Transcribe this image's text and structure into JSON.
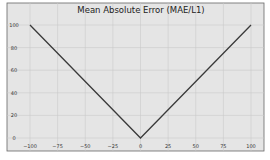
{
  "chart_data": {
    "type": "line",
    "title": "Mean Absolute Error (MAE/L1)",
    "xlabel": "",
    "ylabel": "",
    "xlim": [
      -100,
      100
    ],
    "ylim": [
      0,
      100
    ],
    "grid": true,
    "legend": null,
    "x_ticks": [
      "−100",
      "−75",
      "−50",
      "−25",
      "0",
      "25",
      "50",
      "75",
      "100"
    ],
    "y_ticks": [
      "0",
      "20",
      "40",
      "60",
      "80",
      "100"
    ],
    "series": [
      {
        "name": "|x|",
        "x": [
          -100,
          0,
          100
        ],
        "y": [
          100,
          0,
          100
        ],
        "color": "#3a3a3a"
      }
    ]
  },
  "colors": {
    "background": "#e5e5e5",
    "grid": "#c8c8c8",
    "frame": "#555555",
    "line": "#3a3a3a"
  }
}
